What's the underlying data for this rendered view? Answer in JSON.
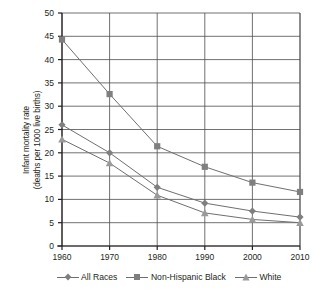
{
  "chart_data": {
    "type": "line",
    "title": "",
    "xlabel": "",
    "ylabel": "Infant mortality rate (deaths per 1000 live births)",
    "ylabel_line1": "Infant mortality rate",
    "ylabel_line2": "(deaths per 1000 live births)",
    "categories": [
      "1960",
      "1970",
      "1980",
      "1990",
      "2000",
      "2010"
    ],
    "x": [
      1960,
      1970,
      1980,
      1990,
      2000,
      2010
    ],
    "series": [
      {
        "name": "All Races",
        "marker": "diamond",
        "color": "#7f7f7f",
        "values": [
          26.0,
          20.0,
          12.6,
          9.2,
          7.5,
          6.2
        ]
      },
      {
        "name": "Non-Hispanic Black",
        "marker": "square",
        "color": "#7f7f7f",
        "values": [
          44.3,
          32.6,
          21.4,
          17.0,
          13.6,
          11.6
        ]
      },
      {
        "name": "White",
        "marker": "triangle",
        "color": "#9a9a9a",
        "values": [
          22.9,
          17.8,
          10.9,
          7.1,
          5.7,
          5.0
        ]
      }
    ],
    "ylim": [
      0,
      50
    ],
    "ytick_step": 5,
    "yticks": [
      "50",
      "45",
      "40",
      "35",
      "30",
      "25",
      "20",
      "15",
      "10",
      "5",
      "0"
    ],
    "grid": true,
    "legend_position": "bottom"
  },
  "legend": {
    "items": [
      {
        "label": "All Races",
        "marker": "diamond"
      },
      {
        "label": "Non-Hispanic Black",
        "marker": "square"
      },
      {
        "label": "White",
        "marker": "triangle"
      }
    ]
  },
  "colors": {
    "axis": "#231f20",
    "grid": "#4d4d4d",
    "series_line": "#6f6f6f",
    "marker_dark": "#7f7f7f",
    "marker_light": "#9a9a9a",
    "background": "#ffffff"
  }
}
